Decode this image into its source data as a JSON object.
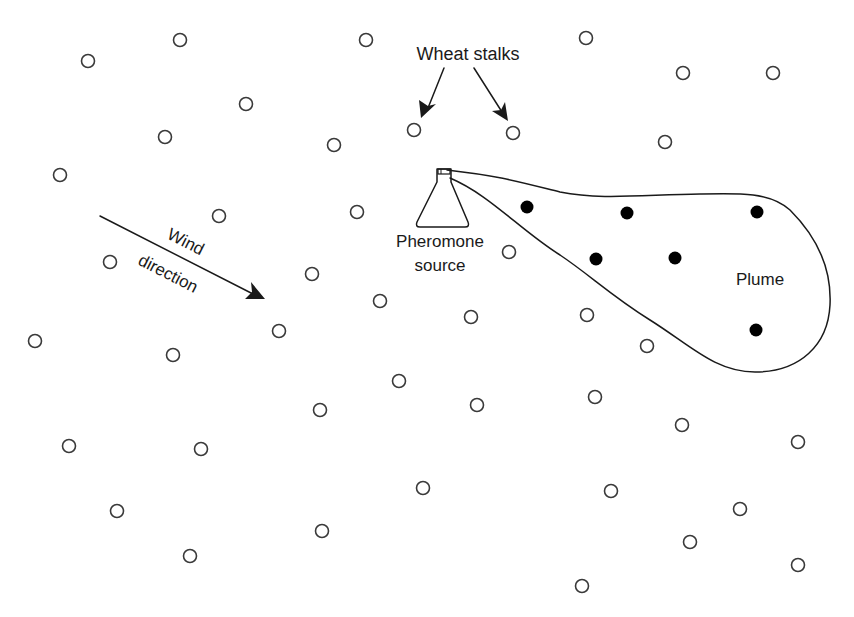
{
  "labels": {
    "wheat_stalks": "Wheat stalks",
    "pheromone_line1": "Pheromone",
    "pheromone_line2": "source",
    "wind_line1": "Wind",
    "wind_line2": "direction",
    "plume": "Plume"
  },
  "colors": {
    "background": "#ffffff",
    "stroke": "#1a1a1a",
    "stalk_stroke": "#3a3a3a",
    "filled_dot": "#000000"
  },
  "wheat_stalks": [
    [
      180,
      40
    ],
    [
      366,
      40
    ],
    [
      586,
      38
    ],
    [
      88,
      61
    ],
    [
      683,
      73
    ],
    [
      773,
      73
    ],
    [
      246,
      104
    ],
    [
      165,
      137
    ],
    [
      414,
      130
    ],
    [
      513,
      133
    ],
    [
      334,
      145
    ],
    [
      665,
      142
    ],
    [
      60,
      175
    ],
    [
      219,
      216
    ],
    [
      357,
      212
    ],
    [
      110,
      262
    ],
    [
      509,
      252
    ],
    [
      312,
      274
    ],
    [
      380,
      301
    ],
    [
      471,
      317
    ],
    [
      587,
      315
    ],
    [
      279,
      331
    ],
    [
      35,
      341
    ],
    [
      173,
      355
    ],
    [
      647,
      346
    ],
    [
      399,
      381
    ],
    [
      320,
      410
    ],
    [
      477,
      405
    ],
    [
      595,
      397
    ],
    [
      682,
      425
    ],
    [
      69,
      446
    ],
    [
      201,
      449
    ],
    [
      798,
      442
    ],
    [
      423,
      488
    ],
    [
      611,
      491
    ],
    [
      117,
      511
    ],
    [
      740,
      509
    ],
    [
      322,
      531
    ],
    [
      690,
      542
    ],
    [
      190,
      556
    ],
    [
      798,
      565
    ],
    [
      582,
      586
    ]
  ],
  "plume_insects": [
    [
      527,
      207
    ],
    [
      627,
      213
    ],
    [
      757,
      212
    ],
    [
      596,
      259
    ],
    [
      675,
      258
    ],
    [
      756,
      330
    ]
  ]
}
